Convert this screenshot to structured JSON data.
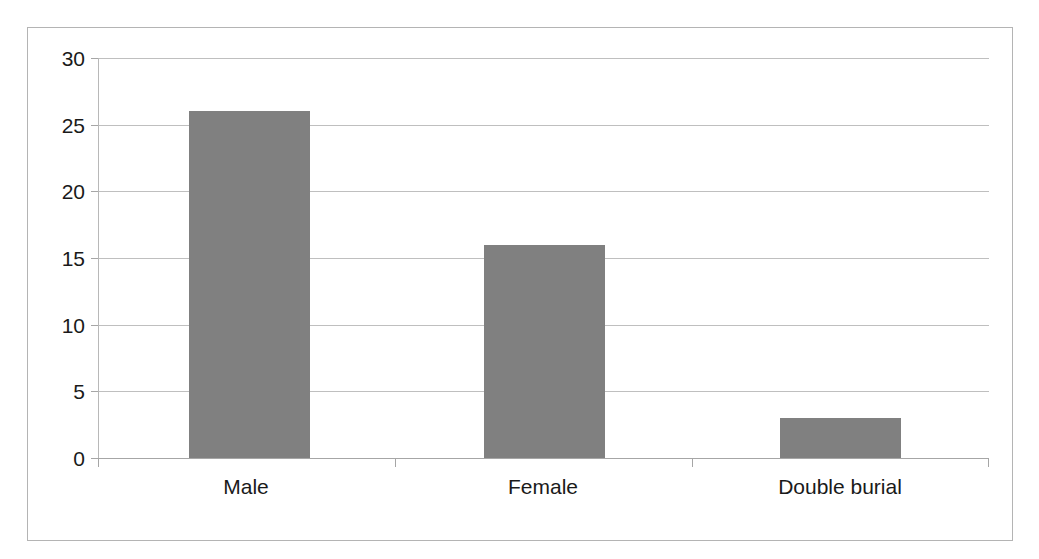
{
  "chart_data": {
    "type": "bar",
    "title": "",
    "subtitle": "",
    "xlabel": "",
    "ylabel": "",
    "categories": [
      "Male",
      "Female",
      "Double burial"
    ],
    "values": [
      26,
      16,
      3
    ],
    "series": [
      {
        "name": "Count",
        "values": [
          26,
          16,
          3
        ]
      }
    ],
    "ylim": [
      0,
      30
    ],
    "y_ticks": [
      0,
      5,
      10,
      15,
      20,
      25,
      30
    ],
    "y_tick_labels": [
      "0",
      "5",
      "10",
      "15",
      "20",
      "25",
      "30"
    ],
    "grid": true,
    "grid_axis": "y",
    "legend": false,
    "legend_position": "none",
    "bar_color": "#808080",
    "grid_color": "#bfbfbf",
    "axis_color": "#a6a6a6",
    "frame_color": "#b4b4b4",
    "background_color": "#ffffff",
    "text_color": "#1a1a1a",
    "annotations": []
  }
}
